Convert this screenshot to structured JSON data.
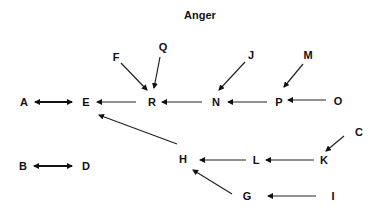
{
  "title": "Anger",
  "nodes": {
    "A": {
      "label": "A",
      "x": 24,
      "y": 102
    },
    "E": {
      "label": "E",
      "x": 86,
      "y": 102
    },
    "R": {
      "label": "R",
      "x": 152,
      "y": 102
    },
    "N": {
      "label": "N",
      "x": 216,
      "y": 102
    },
    "P": {
      "label": "P",
      "x": 279,
      "y": 102
    },
    "O": {
      "label": "O",
      "x": 338,
      "y": 102
    },
    "F": {
      "label": "F",
      "x": 116,
      "y": 57
    },
    "Q": {
      "label": "Q",
      "x": 163,
      "y": 47
    },
    "J": {
      "label": "J",
      "x": 251,
      "y": 55
    },
    "M": {
      "label": "M",
      "x": 308,
      "y": 55
    },
    "H": {
      "label": "H",
      "x": 183,
      "y": 159
    },
    "L": {
      "label": "L",
      "x": 256,
      "y": 160
    },
    "K": {
      "label": "K",
      "x": 324,
      "y": 160
    },
    "C": {
      "label": "C",
      "x": 359,
      "y": 132
    },
    "G": {
      "label": "G",
      "x": 247,
      "y": 196
    },
    "I": {
      "label": "I",
      "x": 333,
      "y": 196
    },
    "B": {
      "label": "B",
      "x": 23,
      "y": 166
    },
    "D": {
      "label": "D",
      "x": 86,
      "y": 166
    }
  },
  "edges": [
    {
      "from": "A",
      "to": "E",
      "bidirectional": true
    },
    {
      "from": "B",
      "to": "D",
      "bidirectional": true
    },
    {
      "from": "R",
      "to": "E"
    },
    {
      "from": "F",
      "to": "R"
    },
    {
      "from": "Q",
      "to": "R"
    },
    {
      "from": "N",
      "to": "R"
    },
    {
      "from": "J",
      "to": "N"
    },
    {
      "from": "P",
      "to": "N"
    },
    {
      "from": "M",
      "to": "P"
    },
    {
      "from": "O",
      "to": "P"
    },
    {
      "from": "H",
      "to": "E"
    },
    {
      "from": "L",
      "to": "H"
    },
    {
      "from": "K",
      "to": "L"
    },
    {
      "from": "C",
      "to": "K"
    },
    {
      "from": "G",
      "to": "H"
    },
    {
      "from": "I",
      "to": "G"
    }
  ]
}
